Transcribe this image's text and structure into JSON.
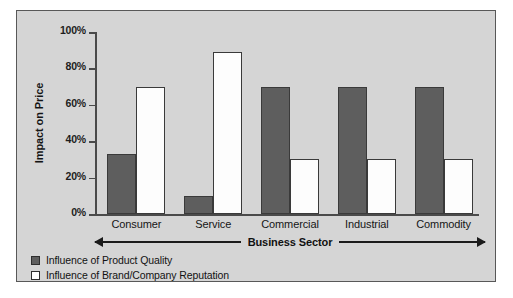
{
  "chart_data": {
    "type": "bar",
    "title": "",
    "xlabel": "Business Sector",
    "ylabel": "Impact on Price",
    "categories": [
      "Consumer",
      "Service",
      "Commercial",
      "Industrial",
      "Commodity"
    ],
    "series": [
      {
        "name": "Influence of Product Quality",
        "swatch": "dark",
        "color": "#5e5e5e",
        "values": [
          33,
          10,
          70,
          70,
          70
        ]
      },
      {
        "name": "Influence of Brand/Company Reputation",
        "swatch": "light",
        "color": "#ffffff",
        "values": [
          70,
          89,
          30,
          30,
          30
        ]
      }
    ],
    "ylim": [
      0,
      100
    ],
    "ytick_values": [
      0,
      20,
      40,
      60,
      80,
      100
    ],
    "ytick_labels": [
      "0%",
      "20%",
      "40%",
      "60%",
      "80%",
      "100%"
    ],
    "grid": false,
    "legend_position": "below-left",
    "value_suffix": "%"
  },
  "figure": {
    "background_color": "#d5d5d5",
    "border_color": "#585858",
    "axis_color": "#4a4a4a"
  },
  "axis_title": {
    "left_arrow": "left-arrow-icon",
    "right_arrow": "right-arrow-icon"
  }
}
